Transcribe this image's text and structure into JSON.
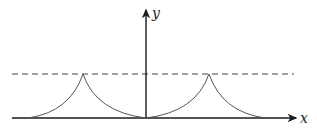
{
  "diagram": {
    "axes": {
      "x_label": "x",
      "y_label": "y"
    },
    "elements": [
      {
        "type": "dashed-horizontal-line",
        "description": "asymptote / max height level"
      },
      {
        "type": "curve",
        "description": "periodic cusped arches (cycloid-like), cusps at top"
      }
    ],
    "colors": {
      "axis": "#1a1a1a",
      "curve": "#555555",
      "dashed": "#444444",
      "background": "#ffffff"
    }
  }
}
